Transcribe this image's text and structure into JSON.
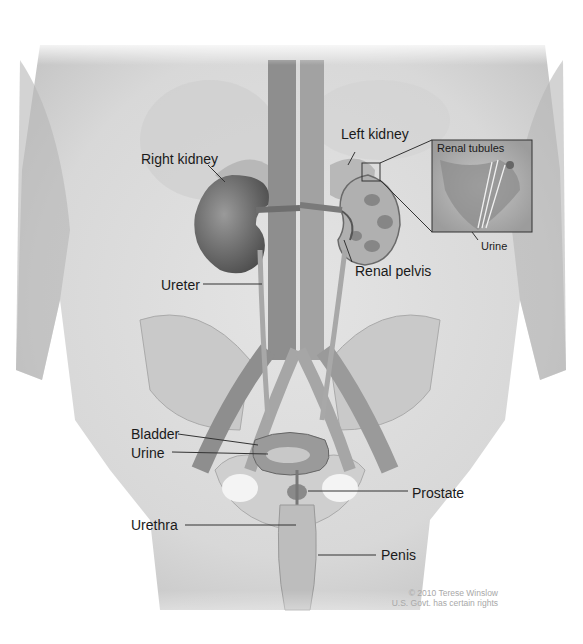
{
  "figure": {
    "labels": {
      "right_kidney": "Right kidney",
      "left_kidney": "Left kidney",
      "renal_tubules": "Renal tubules",
      "urine_inset": "Urine",
      "ureter": "Ureter",
      "renal_pelvis": "Renal pelvis",
      "bladder": "Bladder",
      "urine": "Urine",
      "prostate": "Prostate",
      "urethra": "Urethra",
      "penis": "Penis"
    },
    "credit": {
      "line1": "© 2010 Terese Winslow",
      "line2": "U.S. Govt. has certain rights"
    }
  }
}
